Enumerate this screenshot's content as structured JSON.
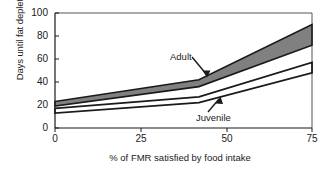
{
  "chart_data": {
    "type": "area",
    "title": "",
    "xlabel": "% of FMR satisfied by food intake",
    "ylabel": "Days until fat depletion",
    "xlim": [
      0,
      75
    ],
    "ylim": [
      0,
      100
    ],
    "xticks": [
      0,
      25,
      50,
      75
    ],
    "yticks": [
      0,
      20,
      40,
      60,
      80,
      100
    ],
    "xtick_labels": [
      "0",
      "25",
      "50",
      "75"
    ],
    "ytick_labels": [
      "0",
      "20",
      "40",
      "60",
      "80",
      "100"
    ],
    "grid": false,
    "legend_position": "inline-annotation",
    "band_fill_color": "#808080",
    "band_edge_color": "#1a1a1a",
    "series": [
      {
        "name": "Adult",
        "kind": "band",
        "x": [
          0,
          42,
          75
        ],
        "upper": [
          23,
          42,
          90
        ],
        "lower": [
          19,
          36,
          72
        ],
        "annotation": "Adult"
      },
      {
        "name": "Juvenile",
        "kind": "band",
        "x": [
          0,
          42,
          75
        ],
        "upper": [
          17,
          27,
          57
        ],
        "lower": [
          13,
          22,
          48
        ],
        "annotation": "Juvenile"
      }
    ],
    "annotations": [
      {
        "text": "Adult",
        "points_to_series": "Adult"
      },
      {
        "text": "Juvenile",
        "points_to_series": "Juvenile"
      }
    ]
  },
  "axis": {
    "y_title": "Days until fat depletion",
    "x_title": "% of FMR satisfied by food intake",
    "y_labels": [
      "100",
      "80",
      "60",
      "40",
      "20",
      "0"
    ],
    "x_labels": [
      "0",
      "25",
      "50",
      "75"
    ]
  },
  "labels": {
    "adult": "Adult",
    "juvenile": "Juvenile"
  }
}
